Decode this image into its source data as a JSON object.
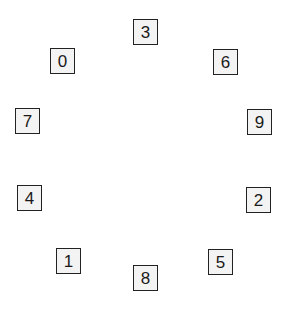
{
  "diagram": {
    "boxes": [
      {
        "label": "3",
        "x": 133,
        "y": 19
      },
      {
        "label": "0",
        "x": 50,
        "y": 48
      },
      {
        "label": "6",
        "x": 213,
        "y": 49
      },
      {
        "label": "7",
        "x": 15,
        "y": 108
      },
      {
        "label": "9",
        "x": 247,
        "y": 109
      },
      {
        "label": "4",
        "x": 17,
        "y": 185
      },
      {
        "label": "2",
        "x": 246,
        "y": 187
      },
      {
        "label": "1",
        "x": 56,
        "y": 248
      },
      {
        "label": "5",
        "x": 208,
        "y": 249
      },
      {
        "label": "8",
        "x": 133,
        "y": 265
      }
    ]
  }
}
